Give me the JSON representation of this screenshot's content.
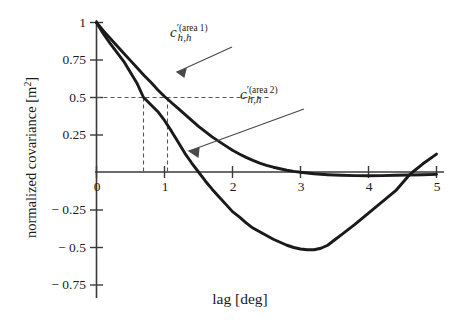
{
  "chart_data": {
    "type": "line",
    "title": "",
    "xlabel": "lag [deg]",
    "ylabel": "normalized covariance [m²]",
    "ylabel_text": "normalized covariance [m",
    "ylabel_sup": "2",
    "ylabel_tail": "]",
    "xlim": [
      0,
      5
    ],
    "ylim": [
      -0.75,
      1
    ],
    "grid": false,
    "legend_position": "inline-annotations",
    "xticks": [
      "0",
      "1",
      "2",
      "3",
      "4",
      "5"
    ],
    "xtick_values": [
      0,
      1,
      2,
      3,
      4,
      5
    ],
    "yticks": [
      "1",
      "0.75",
      "0.5",
      "0.25",
      "− 0.25",
      "− 0.5",
      "− 0.75"
    ],
    "ytick_values": [
      1,
      0.75,
      0.5,
      0.25,
      -0.25,
      -0.5,
      -0.75
    ],
    "origin_label": "0",
    "series": [
      {
        "name": "c_h,h (area 1)",
        "label_base": "c",
        "label_prime": "′",
        "label_sub": "h,h",
        "label_sup": "(area 1)",
        "color": "#1a1a1a",
        "x": [
          0,
          0.1,
          0.2,
          0.3,
          0.4,
          0.5,
          0.6,
          0.7,
          0.8,
          0.9,
          1.0,
          1.04,
          1.1,
          1.2,
          1.3,
          1.4,
          1.5,
          1.6,
          1.7,
          1.8,
          1.9,
          2.0,
          2.1,
          2.2,
          2.3,
          2.4,
          2.5,
          2.6,
          2.7,
          2.8,
          2.9,
          3.0,
          3.2,
          3.4,
          3.6,
          3.8,
          4.0,
          4.2,
          4.4,
          4.6,
          4.8,
          5.0
        ],
        "y": [
          1.0,
          0.945,
          0.895,
          0.845,
          0.795,
          0.745,
          0.695,
          0.645,
          0.6,
          0.55,
          0.505,
          0.49,
          0.465,
          0.425,
          0.385,
          0.345,
          0.305,
          0.27,
          0.235,
          0.205,
          0.175,
          0.145,
          0.12,
          0.098,
          0.078,
          0.06,
          0.045,
          0.032,
          0.022,
          0.012,
          0.004,
          -0.002,
          -0.012,
          -0.018,
          -0.022,
          -0.024,
          -0.025,
          -0.024,
          -0.022,
          -0.02,
          -0.018,
          -0.016
        ]
      },
      {
        "name": "c_h,h (area 2)",
        "label_base": "c",
        "label_prime": "′",
        "label_sub": "h,h",
        "label_sup": "(area 2)",
        "color": "#1a1a1a",
        "x": [
          0,
          0.1,
          0.2,
          0.3,
          0.4,
          0.5,
          0.6,
          0.69,
          0.8,
          0.9,
          1.0,
          1.1,
          1.2,
          1.3,
          1.4,
          1.5,
          1.6,
          1.7,
          1.8,
          1.9,
          2.0,
          2.1,
          2.2,
          2.3,
          2.4,
          2.5,
          2.6,
          2.7,
          2.8,
          2.9,
          3.0,
          3.1,
          3.2,
          3.3,
          3.4,
          3.5,
          3.6,
          3.8,
          4.0,
          4.2,
          4.4,
          4.6,
          4.65,
          4.8,
          5.0
        ],
        "y": [
          1.0,
          0.925,
          0.86,
          0.8,
          0.74,
          0.665,
          0.59,
          0.5,
          0.45,
          0.405,
          0.345,
          0.275,
          0.2,
          0.125,
          0.06,
          0.0,
          -0.06,
          -0.115,
          -0.165,
          -0.215,
          -0.265,
          -0.3,
          -0.34,
          -0.375,
          -0.4,
          -0.425,
          -0.45,
          -0.47,
          -0.49,
          -0.505,
          -0.515,
          -0.52,
          -0.52,
          -0.51,
          -0.49,
          -0.455,
          -0.42,
          -0.35,
          -0.275,
          -0.2,
          -0.125,
          -0.02,
          0.0,
          0.055,
          0.12
        ]
      }
    ],
    "guides": [
      {
        "name": "horizontal-guide-0.5",
        "type": "dashed-horizontal",
        "y": 0.5,
        "x_from": 0,
        "x_to": 2.55
      },
      {
        "name": "vertical-guide-area2",
        "type": "dashed-vertical",
        "x": 0.69,
        "y_from": 0,
        "y_to": 0.5
      },
      {
        "name": "vertical-guide-area1",
        "type": "dashed-vertical",
        "x": 1.04,
        "y_from": 0,
        "y_to": 0.5
      }
    ],
    "annotations": [
      {
        "name": "area-1-leader",
        "from_x": 2.0,
        "from_y": 0.83,
        "to_x": 1.18,
        "to_y": 0.56
      },
      {
        "name": "area-2-leader",
        "from_x": 3.06,
        "from_y": 0.43,
        "to_x": 1.36,
        "to_y": 0.125
      }
    ]
  },
  "labels": {
    "area1": {
      "x_px": 170,
      "y_px": 22
    },
    "area2": {
      "x_px": 240,
      "y_px": 84
    }
  }
}
